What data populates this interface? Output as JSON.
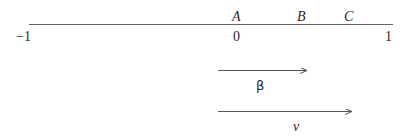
{
  "diagram": {
    "number_line": {
      "range": [
        -1,
        1
      ],
      "ticks": [
        {
          "label": "−1",
          "value": -1
        },
        {
          "label": "0",
          "value": 0
        },
        {
          "label": "1",
          "value": 1
        }
      ],
      "points": [
        {
          "label": "A",
          "value": 0
        },
        {
          "label": "B",
          "value": 0.43
        },
        {
          "label": "C",
          "value": 0.74
        }
      ]
    },
    "vectors": [
      {
        "label": "β",
        "from": 0,
        "to": 0.59
      },
      {
        "label": "v",
        "from": 0,
        "to": 0.88
      }
    ],
    "colors": {
      "line": "#555555",
      "text": "#2a2a2a",
      "background": "#ffffff"
    }
  }
}
